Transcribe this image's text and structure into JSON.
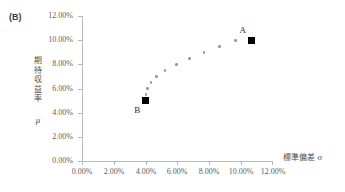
{
  "figure": {
    "panel_label": "(B)"
  },
  "chart_data": {
    "type": "scatter",
    "title": "",
    "subtitle": "",
    "xlabel": "標準偏差",
    "xlabel_symbol": "σ",
    "ylabel": "期待収益率",
    "ylabel_symbol": "μ",
    "ylabel_chars": [
      "期",
      "待",
      "収",
      "益",
      "率"
    ],
    "xlim": [
      0,
      12
    ],
    "ylim": [
      0,
      12
    ],
    "xticks": [
      0,
      2,
      4,
      6,
      8,
      10,
      12
    ],
    "yticks": [
      0,
      2,
      4,
      6,
      8,
      10,
      12
    ],
    "xtick_labels": [
      "0.00%",
      "2.00%",
      "4.00%",
      "6.00%",
      "8.00%",
      "10.00%",
      "12.00%"
    ],
    "ytick_labels": [
      "0.00%",
      "2.00%",
      "4.00%",
      "6.00%",
      "8.00%",
      "10.00%",
      "12.00%"
    ],
    "grid": false,
    "legend": false,
    "unit": "%",
    "series": [
      {
        "name": "efficient-frontier",
        "marker": "small-gray-dot",
        "color": "#9a9a9a",
        "points": [
          {
            "x": 4.05,
            "y": 5.5
          },
          {
            "x": 4.15,
            "y": 6.0
          },
          {
            "x": 4.35,
            "y": 6.5
          },
          {
            "x": 4.7,
            "y": 7.0
          },
          {
            "x": 5.25,
            "y": 7.5
          },
          {
            "x": 5.95,
            "y": 8.0
          },
          {
            "x": 6.8,
            "y": 8.5
          },
          {
            "x": 7.7,
            "y": 9.0
          },
          {
            "x": 8.7,
            "y": 9.5
          },
          {
            "x": 9.7,
            "y": 9.95
          }
        ]
      },
      {
        "name": "labeled-assets",
        "marker": "black-square",
        "color": "#000000",
        "points": [
          {
            "x": 10.7,
            "y": 10.0,
            "label": "A",
            "label_pos": "above-left"
          },
          {
            "x": 4.0,
            "y": 5.0,
            "label": "B",
            "label_pos": "below-left"
          }
        ]
      }
    ]
  }
}
